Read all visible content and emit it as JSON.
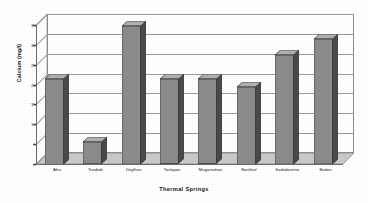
{
  "chart_data": {
    "type": "bar",
    "title": "",
    "xlabel": "Thermal Springs",
    "ylabel": "Calcium (mg/l)",
    "categories": [
      "Afra",
      "Tandiab",
      "Deylhon",
      "Taslapan",
      "Magarnahan",
      "Bankhol",
      "Saidaborena",
      "Boden"
    ],
    "values": [
      21.5,
      5.5,
      34.8,
      21.3,
      21.3,
      19.5,
      27.5,
      31.5
    ],
    "ylim": [
      0,
      35
    ],
    "ytick_labels": [
      "35",
      "30",
      "25",
      "20",
      "15",
      "10",
      "5",
      "0"
    ],
    "ytick_values": [
      35,
      30,
      25,
      20,
      15,
      10,
      5,
      0
    ],
    "grid": true,
    "legend": false,
    "style": "3d-column",
    "colors": {
      "bar_face": "#8b8b8b",
      "bar_side": "#4a4a4a",
      "bar_top": "#b0b0b0",
      "bar_outline": "#2c2c2c",
      "gridline": "#9a9a9a",
      "axis": "#6a6a6a",
      "floor": "#c9c9c9",
      "wall": "#ffffff",
      "text": "#1f1f1f",
      "background": "#ffffff"
    }
  }
}
